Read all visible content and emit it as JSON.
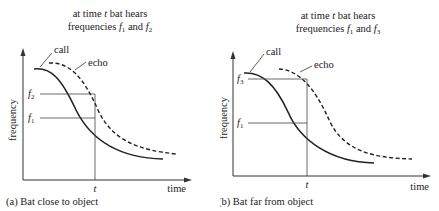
{
  "panels": [
    {
      "id": "a",
      "title_line1": "at time t bat hears",
      "title_line2_prefix": "frequencies ",
      "title_f1": "f",
      "title_f1_sub": "1",
      "title_and": " and ",
      "title_f2": "f",
      "title_f2_sub": "2",
      "call_label": "call",
      "echo_label": "echo",
      "y_label": "frequency",
      "x_label": "time",
      "t_label": "t",
      "f_upper": "f",
      "f_upper_sub": "2",
      "f_lower": "f",
      "f_lower_sub": "1",
      "caption": "(a) Bat close to object"
    },
    {
      "id": "b",
      "title_line1": "at time t bat hears",
      "title_line2_prefix": "frequencies ",
      "title_f1": "f",
      "title_f1_sub": "1",
      "title_and": " and ",
      "title_f2": "f",
      "title_f2_sub": "3",
      "call_label": "call",
      "echo_label": "echo",
      "y_label": "frequency",
      "x_label": "time",
      "t_label": "t",
      "f_upper": "f",
      "f_upper_sub": "3",
      "f_lower": "f",
      "f_lower_sub": "1",
      "caption": "(b) Bat far from object"
    }
  ]
}
